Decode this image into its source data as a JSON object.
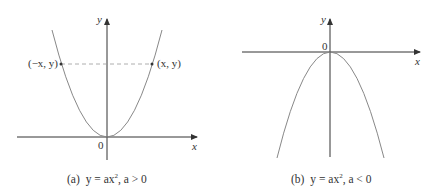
{
  "panels": [
    {
      "id": "a",
      "axis_x_label": "x",
      "axis_y_label": "y",
      "origin_label": "0",
      "point_left_label": "(−x, y)",
      "point_right_label": "(x, y)",
      "caption_prefix": "(a)",
      "caption_eq": "y = ax",
      "caption_exp": "2",
      "caption_cond": ",  a > 0"
    },
    {
      "id": "b",
      "axis_x_label": "x",
      "axis_y_label": "y",
      "origin_label": "0",
      "caption_prefix": "(b)",
      "caption_eq": "y = ax",
      "caption_exp": "2",
      "caption_cond": ",  a < 0"
    }
  ],
  "colors": {
    "curve": "#888888",
    "axis": "#333333",
    "dash": "#888888"
  }
}
